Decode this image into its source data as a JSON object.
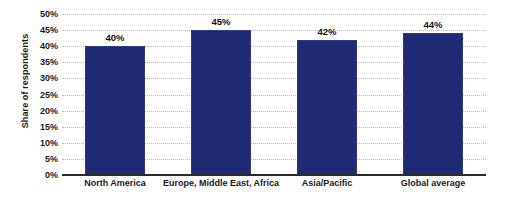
{
  "chart_data": {
    "type": "bar",
    "title": "",
    "subtitle": "",
    "xlabel": "",
    "ylabel": "Share of respondents",
    "categories": [
      "North America",
      "Europe, Middle East, Africa",
      "Asia/Pacific",
      "Global average"
    ],
    "values": [
      40,
      45,
      42,
      44
    ],
    "value_labels": [
      "40%",
      "45%",
      "42%",
      "44%"
    ],
    "ylim": [
      0,
      50
    ],
    "ytick_values": [
      0,
      5,
      10,
      15,
      20,
      25,
      30,
      35,
      40,
      45,
      50
    ],
    "ytick_labels": [
      "0%",
      "5%",
      "10%",
      "15%",
      "20%",
      "25%",
      "30%",
      "35%",
      "40%",
      "45%",
      "50%"
    ],
    "grid": true,
    "grid_axis": "y",
    "grid_style": "dotted",
    "legend": false,
    "legend_position": "none",
    "bar_color": "#1f2a72",
    "label_color": "#111111",
    "grid_color": "#b9b9b9",
    "axis_color": "#2b2b2b",
    "background_color": "#ffffff"
  }
}
